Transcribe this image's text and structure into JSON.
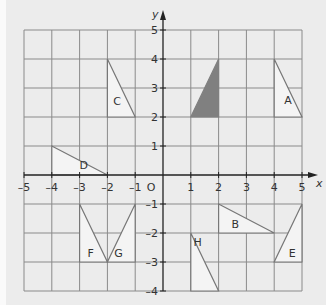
{
  "axes": {
    "x_label": "x",
    "y_label": "y",
    "origin_label": "O",
    "x_ticks": [
      "-5",
      "-4",
      "-3",
      "-2",
      "-1",
      "1",
      "2",
      "3",
      "4",
      "5"
    ],
    "y_ticks": [
      "5",
      "4",
      "3",
      "2",
      "1",
      "-1",
      "-2",
      "-3",
      "-4"
    ],
    "xlim": [
      -5,
      5
    ],
    "ylim": [
      -4,
      5
    ]
  },
  "shapes": [
    {
      "label": "object",
      "filled": true,
      "points": [
        [
          1,
          2
        ],
        [
          2,
          2
        ],
        [
          2,
          4
        ]
      ],
      "color": "#808080"
    },
    {
      "label": "A",
      "points": [
        [
          4,
          4
        ],
        [
          5,
          2
        ],
        [
          4,
          2
        ]
      ]
    },
    {
      "label": "B",
      "points": [
        [
          2,
          -1
        ],
        [
          4,
          -2
        ],
        [
          2,
          -2
        ]
      ]
    },
    {
      "label": "C",
      "points": [
        [
          -2,
          4
        ],
        [
          -1,
          2
        ],
        [
          -2,
          2
        ]
      ]
    },
    {
      "label": "D",
      "points": [
        [
          -4,
          1
        ],
        [
          -2,
          0
        ],
        [
          -4,
          0
        ]
      ]
    },
    {
      "label": "E",
      "points": [
        [
          5,
          -1
        ],
        [
          4,
          -3
        ],
        [
          5,
          -3
        ]
      ]
    },
    {
      "label": "F",
      "points": [
        [
          -3,
          -1
        ],
        [
          -2,
          -3
        ],
        [
          -3,
          -3
        ]
      ]
    },
    {
      "label": "G",
      "points": [
        [
          -1,
          -1
        ],
        [
          -2,
          -3
        ],
        [
          -1,
          -3
        ]
      ]
    },
    {
      "label": "H",
      "points": [
        [
          1,
          -2
        ],
        [
          2,
          -4
        ],
        [
          1,
          -4
        ]
      ]
    }
  ],
  "labels": {
    "A": "A",
    "B": "B",
    "C": "C",
    "D": "D",
    "E": "E",
    "F": "F",
    "G": "G",
    "H": "H"
  }
}
